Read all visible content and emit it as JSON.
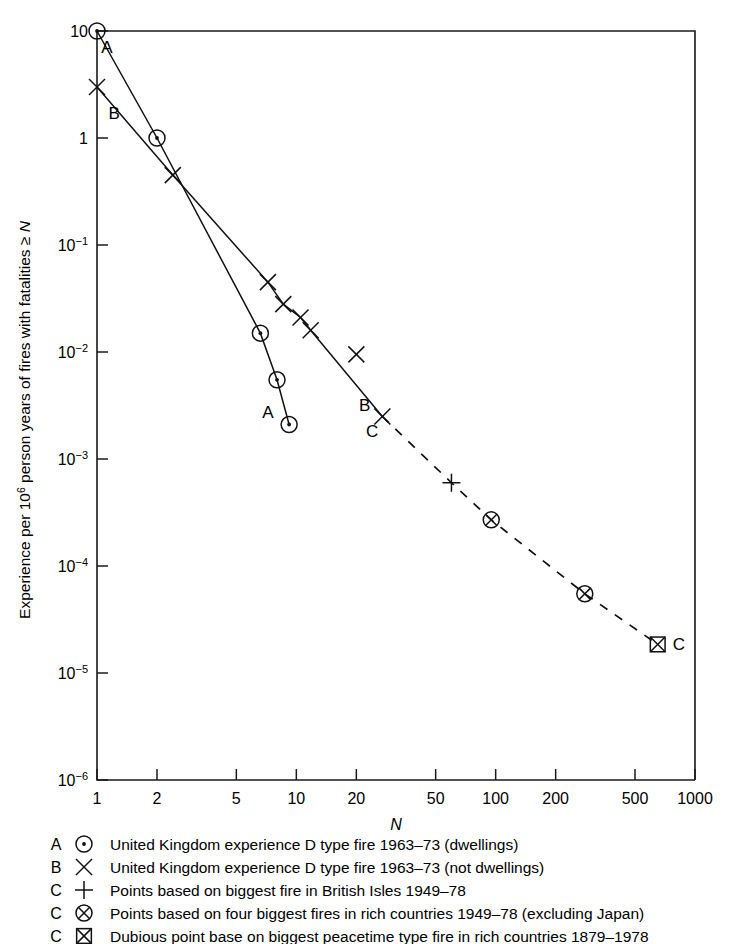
{
  "chart_data": {
    "type": "line",
    "title": "",
    "subtitle": "",
    "xlabel": "N",
    "ylabel": "Experience per 10⁶ person years of fires with fatalities ≥ N",
    "xscale": "log",
    "yscale": "log",
    "xlim": [
      1,
      1000
    ],
    "ylim": [
      1e-06,
      10
    ],
    "grid": false,
    "legend_position": "below-plot",
    "x_ticks": [
      1,
      2,
      5,
      10,
      20,
      50,
      100,
      200,
      500,
      1000
    ],
    "x_tick_labels": [
      "1",
      "2",
      "5",
      "10",
      "20",
      "50",
      "100",
      "200",
      "500",
      "1000"
    ],
    "y_ticks": [
      10,
      1,
      0.1,
      0.01,
      0.001,
      0.0001,
      1e-05,
      1e-06
    ],
    "y_tick_labels": [
      "10",
      "1",
      "10⁻¹",
      "10⁻²",
      "10⁻³",
      "10⁻⁴",
      "10⁻⁵",
      "10⁻⁶"
    ],
    "y_tick_mantissa": [
      "10",
      "1",
      "10",
      "10",
      "10",
      "10",
      "10",
      "10"
    ],
    "y_tick_exponent": [
      "",
      "",
      "-1",
      "-2",
      "-3",
      "-4",
      "-5",
      "-6"
    ],
    "series": [
      {
        "name": "A",
        "label": "United Kingdom experience D type fire 1963–73 (dwellings)",
        "marker": "circle-dot",
        "linestyle": "solid",
        "curve_label": "A",
        "x": [
          1.0,
          2.0,
          6.6,
          8.0,
          9.2
        ],
        "y": [
          10.0,
          1.0,
          0.015,
          0.0055,
          0.0021
        ]
      },
      {
        "name": "B",
        "label": "United Kingdom experience D type fire 1963–73 (not dwellings)",
        "marker": "cross-x",
        "linestyle": "solid",
        "curve_label": "B",
        "x": [
          1.0,
          2.4,
          7.2,
          8.6,
          10.5,
          11.8,
          27.0
        ],
        "y": [
          3.0,
          0.45,
          0.045,
          0.028,
          0.021,
          0.016,
          0.0025
        ],
        "outlier_points": [
          {
            "x": 20.0,
            "y": 0.0095
          }
        ]
      },
      {
        "name": "C",
        "label": "Points based on biggest fire in British Isles 1949–78",
        "marker": "plus",
        "linestyle": "dashed",
        "curve_label": "C",
        "x": [
          60.0
        ],
        "y": [
          0.0006
        ]
      },
      {
        "name": "C2",
        "label": "Points based on four biggest fires in rich countries 1949–78 (excluding Japan)",
        "marker": "circle-cross",
        "linestyle": "dashed",
        "curve_label": "C",
        "x": [
          95.0,
          280.0
        ],
        "y": [
          0.00027,
          5.5e-05
        ]
      },
      {
        "name": "C3",
        "label": "Dubious point base on biggest peacetime type fire in rich countries 1879–1978",
        "marker": "square-cross",
        "linestyle": "dashed",
        "curve_label": "C",
        "x": [
          650.0
        ],
        "y": [
          1.85e-05
        ]
      }
    ],
    "dashed_path": {
      "x": [
        27.0,
        60.0,
        95.0,
        280.0,
        650.0
      ],
      "y": [
        0.0025,
        0.0006,
        0.00027,
        5.5e-05,
        1.85e-05
      ]
    },
    "annotations": [
      {
        "text": "A",
        "x": 1.12,
        "y": 6.2,
        "note": "start-of-curve-A"
      },
      {
        "text": "B",
        "x": 1.22,
        "y": 1.5,
        "note": "start-of-curve-B"
      },
      {
        "text": "A",
        "x": 7.2,
        "y": 0.0024,
        "note": "end-of-curve-A"
      },
      {
        "text": "B",
        "x": 22.0,
        "y": 0.0028,
        "note": "end-of-curve-B"
      },
      {
        "text": "C",
        "x": 24.0,
        "y": 0.0016,
        "note": "start-of-curve-C"
      },
      {
        "text": "C",
        "x": 830.0,
        "y": 1.65e-05,
        "note": "end-of-curve-C"
      }
    ]
  },
  "legend": {
    "entries": [
      {
        "letter": "A",
        "symbol": "circle-dot",
        "text": "United Kingdom experience D type fire 1963–73 (dwellings)"
      },
      {
        "letter": "B",
        "symbol": "cross-x",
        "text": "United Kingdom experience D type fire 1963–73 (not dwellings)"
      },
      {
        "letter": "C",
        "symbol": "plus",
        "text": "Points based on biggest fire in British Isles 1949–78"
      },
      {
        "letter": "C",
        "symbol": "circle-cross",
        "text": "Points based on four biggest fires in rich countries 1949–78 (excluding Japan)"
      },
      {
        "letter": "C",
        "symbol": "square-cross",
        "text": "Dubious point base on biggest peacetime type fire in rich countries 1879–1978"
      }
    ]
  },
  "axis_titles": {
    "x": "N",
    "y_parts": {
      "p1": "Experience per 10",
      "sup": "6",
      "p2": " person years of fires with fatalities ≥ ",
      "ital": "N"
    }
  },
  "colors": {
    "ink": "#111111",
    "background": "#ffffff"
  }
}
